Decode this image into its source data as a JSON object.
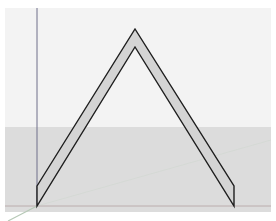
{
  "viewport": {
    "view": "3D model viewport",
    "colors": {
      "sky": "#f3f3f3",
      "ground": "#dcdcdc",
      "face_fill": "#d4d4d4",
      "edge": "#1e1e1e",
      "axis_blue": "#7a7a9a",
      "axis_red": "#9a8080",
      "axis_green": "#b8c8b8"
    }
  },
  "model": {
    "shape": "chevron",
    "outer_apex": [
      135,
      29
    ],
    "inner_apex": [
      135,
      47
    ],
    "left_base_top": [
      37,
      186
    ],
    "left_base_bottom": [
      37,
      206
    ],
    "right_base_top": [
      234,
      186
    ],
    "right_base_bottom": [
      234,
      206
    ]
  }
}
